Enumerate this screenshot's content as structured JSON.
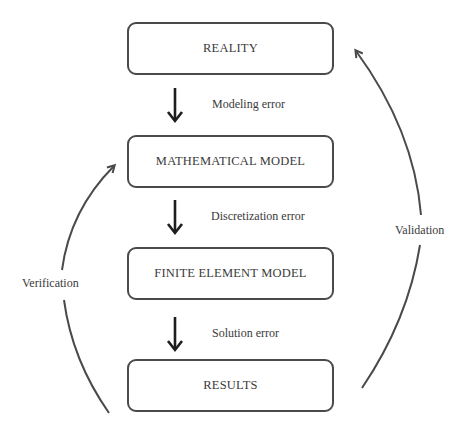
{
  "diagram": {
    "boxes": [
      {
        "label": "REALITY"
      },
      {
        "label": "MATHEMATICAL MODEL"
      },
      {
        "label": "FINITE ELEMENT MODEL"
      },
      {
        "label": "RESULTS"
      }
    ],
    "errors": [
      {
        "label": "Modeling error"
      },
      {
        "label": "Discretization error"
      },
      {
        "label": "Solution error"
      }
    ],
    "loops": {
      "verification": {
        "label": "Verification",
        "from": "RESULTS",
        "to": "MATHEMATICAL MODEL"
      },
      "validation": {
        "label": "Validation",
        "from": "RESULTS",
        "to": "REALITY"
      }
    },
    "colors": {
      "stroke": "#4a4a4a",
      "text": "#3a3a3a",
      "arrow": "#1e1e1e"
    }
  }
}
